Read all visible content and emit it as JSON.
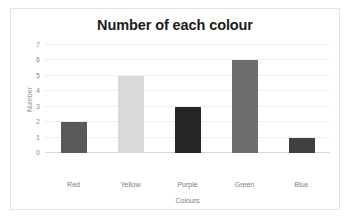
{
  "chart_data": {
    "type": "bar",
    "title": "Number of each colour",
    "xlabel": "Colours",
    "ylabel": "Number",
    "categories": [
      "Red",
      "Yellow",
      "Purple",
      "Green",
      "Blue"
    ],
    "values": [
      2,
      5,
      3,
      6,
      1
    ],
    "bar_colors": [
      "#595959",
      "#d9d9d9",
      "#262626",
      "#6e6e6e",
      "#404040"
    ],
    "ylim": [
      0,
      7
    ],
    "yticks": [
      0,
      1,
      2,
      3,
      4,
      5,
      6,
      7
    ],
    "ytick_labels": [
      "0",
      "1",
      "2",
      "3",
      "4",
      "5",
      "6",
      "7"
    ],
    "grid": true,
    "legend": false,
    "legend_position": "none",
    "series": [
      {
        "name": "Number",
        "values": [
          2,
          5,
          3,
          6,
          1
        ]
      }
    ],
    "colors": {
      "gridline": "#eceef0",
      "axis": "#d6d8da",
      "tick_text": "#8a8a8a",
      "label_text": "#7d7d7d",
      "title_text": "#1a1a1a",
      "frame_border": "#e3e3e3",
      "background": "#ffffff"
    }
  }
}
